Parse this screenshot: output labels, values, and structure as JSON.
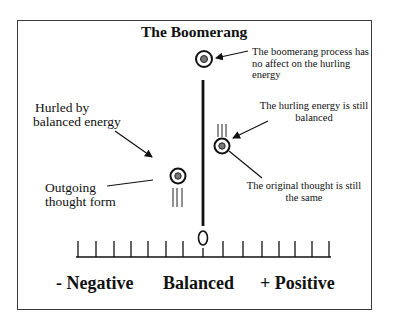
{
  "diagram": {
    "title": "The Boomerang",
    "annotations": {
      "top_note": [
        "The boomerang process has",
        "no affect on the hurling",
        "energy"
      ],
      "right_upper_note": [
        "The hurling energy is still",
        "balanced"
      ],
      "right_lower_note": [
        "The original thought is still",
        "the same"
      ],
      "left_upper_note": [
        "Hurled by",
        "balanced energy"
      ],
      "left_lower_note": [
        "Outgoing",
        "thought form"
      ]
    },
    "scale": {
      "center_marker": "O",
      "tick_count": 15,
      "labels": {
        "negative": "- Negative",
        "balanced": "Balanced",
        "positive": "+ Positive"
      }
    },
    "icons": {
      "thought_form": "concentric-circle-icon",
      "motion": "speed-lines-icon",
      "arrow": "arrow-icon"
    },
    "colors": {
      "ink": "#111111",
      "frame": "#3a3a3a",
      "inner_dot": "#777777",
      "background": "#ffffff"
    }
  }
}
